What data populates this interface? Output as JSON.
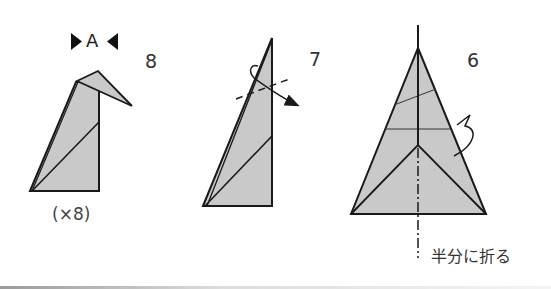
{
  "diagram": {
    "type": "origami-instructions",
    "colors": {
      "paper_fill": "#c9c9c9",
      "stroke": "#1a1a1a",
      "text": "#333333"
    },
    "steps": [
      {
        "number": "8",
        "reference_mark": "A",
        "repeat_note": "(×8)"
      },
      {
        "number": "7"
      },
      {
        "number": "6",
        "instruction": "半分に折る"
      }
    ]
  }
}
